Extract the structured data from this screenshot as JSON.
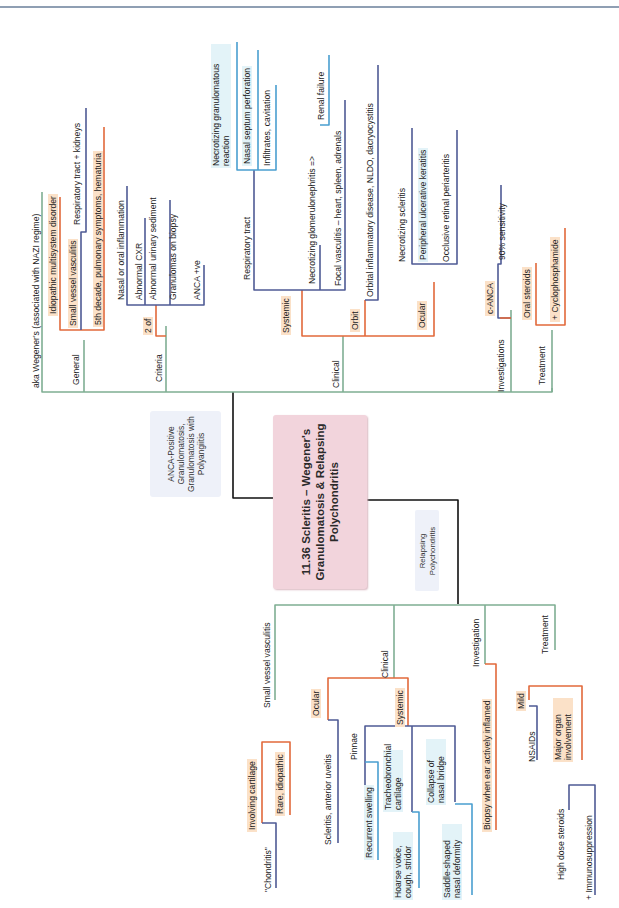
{
  "title": "11.36 Scleritis – Wegener's Granulomatosis & Relapsing Polychondritis",
  "alias_box": "ANCA-Positive Granulomatosis, Granulomatosis with Polyangiitis",
  "relapsing_box": "Relapsing Polychondritis",
  "colors": {
    "green_branch": "#7fae93",
    "orange_branch": "#e2693b",
    "navy_branch": "#4f5b95",
    "blue_branch": "#4a9fd0",
    "title_bg": "#f2d4dc",
    "alias_bg": "#eef1f9",
    "orange_highlight": "#fbe1c8",
    "cyan_highlight": "#e3f3f8"
  },
  "wegener": {
    "aka": "aka Wegener's (associated with NAZI regime)",
    "general": {
      "label": "General",
      "items": {
        "idiopathic": "Idiopathic multisystem disorder",
        "svv": "Small vessel vasculitis",
        "resp_kidneys": "Respiratory tract + kidneys",
        "fifth_decade": "5th decade, pulmonary symptoms, hematuria"
      }
    },
    "criteria": {
      "label": "Criteria",
      "two_of": "2 of",
      "items": [
        "Nasal or oral inflammation",
        "Abnormal CXR",
        "Abnormal urinary sediment",
        "Granulomas on biopsy",
        "ANCA +ve"
      ]
    },
    "clinical": {
      "label": "Clinical",
      "systemic": {
        "label": "Systemic",
        "respiratory": "Respiratory tract",
        "necrotizing_reaction": "Necrotizing granulomatous reaction",
        "nasal_septum": "Nasal septum perforation",
        "infiltrates": "Infiltrates, cavitation",
        "glomerulonephritis": "Necrotizing glomerulonephritis =>",
        "renal_failure": "Renal failure",
        "focal_vasculitis": "Focal vasculitis – heart, spleen, adrenals"
      },
      "orbit": {
        "label": "Orbit",
        "item": "Orbital inflammatory disease, NLDO, dacryocystitis"
      },
      "ocular": {
        "label": "Ocular",
        "items": [
          "Necrotizing scleritis",
          "Peripheral ulcerative keratitis",
          "Occlusive retinal periarteritis"
        ]
      }
    },
    "investigations": {
      "label": "Investigations",
      "canca": "c-ANCA",
      "sensitivity": "90% sensitivity"
    },
    "treatment": {
      "label": "Treatment",
      "oral_steroids": "Oral steroids",
      "cyclophosphamide": "+ Cyclophosphamide"
    }
  },
  "relapsing": {
    "svv": {
      "label": "Small vessel vasculitis",
      "involving_cartilage": "Involving cartilage",
      "rare": "Rare, idiopathic",
      "chondritis": "\"Chondritis\""
    },
    "clinical": {
      "label": "Clinical",
      "ocular": {
        "label": "Ocular",
        "item": "Scleritis, anterior uveitis"
      },
      "systemic": {
        "label": "Systemic",
        "pinnae": "Pinnae",
        "recurrent_swelling": "Recurrent swelling",
        "tracheobronchial": "Tracheobronchial cartilage",
        "hoarse": "Hoarse voice, cough, stridor",
        "nasal_collapse": "Collapse of nasal bridge",
        "saddle": "Saddle-shaped nasal deformity"
      }
    },
    "investigation": {
      "label": "Investigation",
      "biopsy": "Biopsy when ear actively inflamed"
    },
    "treatment": {
      "label": "Treatment",
      "mild": "Mild",
      "nsaids": "NSAIDs",
      "major": "Major organ involvement",
      "high_dose": "High dose steroids",
      "immuno": "+ Immunosuppression"
    }
  }
}
